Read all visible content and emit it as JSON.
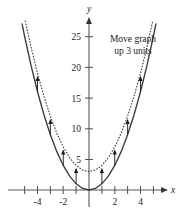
{
  "figure": {
    "name": "parabola-vertical-shift-graph",
    "annotation": {
      "line1": "Move graph",
      "line2": "up 3 units"
    },
    "axes": {
      "x_axis_label": "x",
      "y_axis_label": "y",
      "x_tick_labels": [
        "-4",
        "-2",
        "2",
        "4"
      ],
      "y_tick_labels": [
        "5",
        "10",
        "15",
        "20",
        "25"
      ]
    },
    "colors": {
      "background": "#ffffff",
      "axis": "#555555",
      "solid_curve": "#3a3a3a",
      "dotted_curve": "#4a4a4a",
      "arrow": "#222222",
      "text": "#1a1a1a"
    }
  },
  "chart_data": {
    "type": "line",
    "title": "",
    "xlabel": "x",
    "ylabel": "y",
    "xlim": [
      -5.4,
      5.4
    ],
    "ylim": [
      -1.2,
      27.5
    ],
    "grid": false,
    "legend": null,
    "x_ticks": [
      -5,
      -4,
      -3,
      -2,
      -1,
      1,
      2,
      3,
      4,
      5
    ],
    "x_tick_labels_shown": {
      "-4": "-4",
      "-2": "-2",
      "2": "2",
      "4": "4"
    },
    "y_ticks": [
      5,
      10,
      15,
      20,
      25
    ],
    "y_tick_labels_shown": [
      "5",
      "10",
      "15",
      "20",
      "25"
    ],
    "series": [
      {
        "name": "y = x^2",
        "style": "solid",
        "x": [
          -5.2,
          -5,
          -4.5,
          -4,
          -3.5,
          -3,
          -2.5,
          -2,
          -1.5,
          -1,
          -0.5,
          0,
          0.5,
          1,
          1.5,
          2,
          2.5,
          3,
          3.5,
          4,
          4.5,
          5,
          5.2
        ],
        "values": [
          27.04,
          25,
          20.25,
          16,
          12.25,
          9,
          6.25,
          4,
          2.25,
          1,
          0.25,
          0,
          0.25,
          1,
          2.25,
          4,
          6.25,
          9,
          12.25,
          16,
          20.25,
          25,
          27.04
        ]
      },
      {
        "name": "y = x^2 + 3",
        "style": "dotted",
        "x": [
          -4.95,
          -4.5,
          -4,
          -3.5,
          -3,
          -2.5,
          -2,
          -1.5,
          -1,
          -0.5,
          0,
          0.5,
          1,
          1.5,
          2,
          2.5,
          3,
          3.5,
          4,
          4.5,
          4.95
        ],
        "values": [
          27.5,
          23.25,
          19,
          15.25,
          12,
          9.25,
          7,
          5.25,
          4,
          3.25,
          3,
          3.25,
          4,
          5.25,
          7,
          9.25,
          12,
          15.25,
          19,
          23.25,
          27.5
        ]
      }
    ],
    "shift_arrows": {
      "description": "vertical arrows of length 3 from y = x^2 up to y = x^2 + 3",
      "length": 3,
      "x_positions": [
        -4,
        -3,
        -2,
        -1,
        1,
        2,
        3,
        4
      ],
      "from_values": [
        16,
        9,
        4,
        1,
        1,
        4,
        9,
        16
      ],
      "to_values": [
        19,
        12,
        7,
        4,
        4,
        7,
        12,
        19
      ]
    },
    "annotations": [
      {
        "text": "Move graph up 3 units",
        "x": 2.0,
        "y": 23.5
      }
    ]
  }
}
